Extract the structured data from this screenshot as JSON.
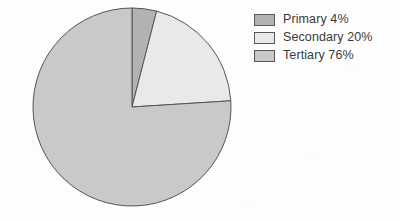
{
  "chart_data": {
    "type": "pie",
    "title": "",
    "categories": [
      "Primary",
      "Secondary",
      "Tertiary"
    ],
    "values": [
      4,
      20,
      76
    ],
    "value_unit": "%",
    "labels": [
      "Primary 4%",
      "Secondary 20%",
      "Tertiary 76%"
    ],
    "colors": [
      "#b2b2b2",
      "#e9e9e9",
      "#c9c9c9"
    ],
    "stroke_color": "#555555",
    "legend_position": "right",
    "start_angle_deg": 0,
    "direction": "clockwise",
    "grid": false,
    "background_color": "#fdfdfd"
  },
  "legend": {
    "items": [
      {
        "label": "Primary 4%",
        "name": "Primary",
        "value": "4%",
        "color": "#b2b2b2"
      },
      {
        "label": "Secondary 20%",
        "name": "Secondary",
        "value": "20%",
        "color": "#e9e9e9"
      },
      {
        "label": "Tertiary 76%",
        "name": "Tertiary",
        "value": "76%",
        "color": "#c9c9c9"
      }
    ]
  },
  "pie": {
    "center_x": 132,
    "center_y": 107,
    "radius": 99,
    "slices": [
      {
        "name": "Primary",
        "percent": 4,
        "color": "#b2b2b2"
      },
      {
        "name": "Secondary",
        "percent": 20,
        "color": "#e9e9e9"
      },
      {
        "name": "Tertiary",
        "percent": 76,
        "color": "#c9c9c9"
      }
    ]
  }
}
